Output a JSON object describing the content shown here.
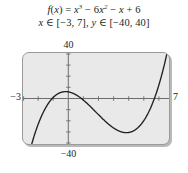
{
  "figure": {
    "name": "cubic-function-graph",
    "background_color": "#ffffff",
    "plot_fill_color": "#e9e9e9",
    "plot_border_color": "#9a9a9a",
    "curve_color": "#231f20",
    "axis_color": "#6d6d6d"
  },
  "caption": {
    "line1": {
      "fx": "f",
      "open": "(",
      "var": "x",
      "close": ")",
      "equals": "=",
      "x1": "x",
      "exp1": "3",
      "minus1": "− 6",
      "x2": "x",
      "exp2": "2",
      "minus2": "−",
      "x3": "x",
      "plus": "+ 6",
      "full": "f(x) = x³ − 6x² − x + 6"
    },
    "line2": {
      "xvar": "x",
      "in1": "∈",
      "xrange": "[−3, 7],",
      "yvar": "y",
      "in2": "∈",
      "yrange": "[−40, 40]",
      "full": "x ∈ [−3, 7], y ∈ [−40, 40]"
    }
  },
  "axis_labels": {
    "y_max": "40",
    "y_min": "−40",
    "x_min": "−3",
    "x_max": "7"
  },
  "chart_data": {
    "type": "line",
    "subtitle": "x ∈ [−3, 7], y ∈ [−40, 40]",
    "xlabel": "",
    "ylabel": "",
    "expression": "x^3 - 6*x^2 - x + 6",
    "xlim": [
      -3,
      7
    ],
    "ylim": [
      -40,
      40
    ],
    "grid": false,
    "legend": "none",
    "axes": {
      "x_axis_at_y": 0,
      "y_axis_at_x": 0,
      "x_tick_spacing": 1,
      "y_tick_spacing": 10,
      "tick_marks": true,
      "tick_labels_shown": false
    },
    "annotations": [
      {
        "text": "40",
        "position": "above-plot-at-x0"
      },
      {
        "text": "−40",
        "position": "below-plot-at-x0"
      },
      {
        "text": "−3",
        "position": "left-of-plot-at-y0"
      },
      {
        "text": "7",
        "position": "right-of-plot-at-y0"
      }
    ],
    "features": {
      "roots": [
        -1,
        1,
        6
      ],
      "local_max": {
        "x": -0.082,
        "y": 6.04
      },
      "local_min": {
        "x": 4.082,
        "y": -36.04
      },
      "y_intercept": 6
    },
    "series": [
      {
        "name": "f(x)",
        "x": [
          -3,
          -2.75,
          -2.5,
          -2.25,
          -2,
          -1.75,
          -1.5,
          -1.25,
          -1,
          -0.75,
          -0.5,
          -0.25,
          0,
          0.25,
          0.5,
          0.75,
          1,
          1.25,
          1.5,
          1.75,
          2,
          2.25,
          2.5,
          2.75,
          3,
          3.25,
          3.5,
          3.75,
          4,
          4.25,
          4.5,
          4.75,
          5,
          5.25,
          5.5,
          5.75,
          6,
          6.25,
          6.5,
          6.75,
          7
        ],
        "values": [
          -72,
          -57.48,
          -44.38,
          -32.64,
          -22,
          -12.48,
          -4.13,
          3.16,
          6,
          7.03,
          -1.75,
          -8.86,
          6,
          2.39,
          -1.88,
          -6.7,
          -12,
          -21.67,
          -25.88,
          -29.77,
          -36,
          -41.11,
          -44.38,
          -47.02,
          -48,
          -47.42,
          -44.63,
          -39.61,
          -36,
          -29.14,
          -18.38,
          -7.36,
          6,
          19.43,
          37.13,
          55.36,
          72,
          93.89,
          116.38,
          140.2,
          168
        ]
      }
    ]
  }
}
